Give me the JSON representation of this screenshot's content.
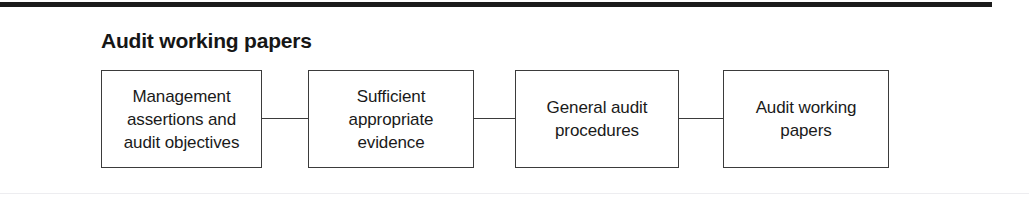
{
  "figure": {
    "title": "Audit working papers",
    "type": "linear-flow-diagram",
    "nodes": [
      {
        "id": "node-0",
        "label": "Management\nassertions and\naudit objectives"
      },
      {
        "id": "node-1",
        "label": "Sufficient\nappropriate\nevidence"
      },
      {
        "id": "node-2",
        "label": "General audit\nprocedures"
      },
      {
        "id": "node-3",
        "label": "Audit working\npapers"
      }
    ],
    "connectors": [
      {
        "id": "conn-0",
        "from": "node-0",
        "to": "node-1"
      },
      {
        "id": "conn-1",
        "from": "node-1",
        "to": "node-2"
      },
      {
        "id": "conn-2",
        "from": "node-2",
        "to": "node-3"
      }
    ],
    "colors": {
      "page_background": "#ffffff",
      "top_rule": "#1b1b1b",
      "bottom_rule": "#ededf0",
      "box_border": "#3b3b3b",
      "text": "#1a1a1a",
      "title_text": "#161616"
    }
  }
}
